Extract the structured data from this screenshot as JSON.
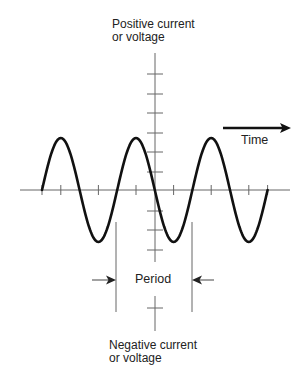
{
  "diagram": {
    "labels": {
      "positive_line1": "Positive current",
      "positive_line2": "or voltage",
      "negative_line1": "Negative current",
      "negative_line2": "or voltage",
      "time": "Time",
      "period": "Period"
    },
    "waveform": {
      "type": "sine",
      "cycles": 3,
      "starts_at": "zero, rising"
    },
    "colors": {
      "wave": "#111111",
      "axis": "#555555",
      "text": "#222222"
    }
  }
}
